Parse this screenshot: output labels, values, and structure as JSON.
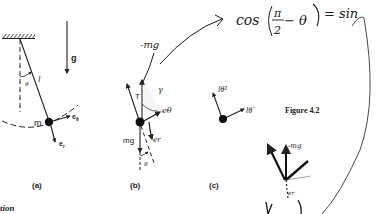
{
  "figure": {
    "caption": "Figure 4.2",
    "partial_heading": "tion"
  },
  "panel_a": {
    "label": "(a)",
    "gravity": "g",
    "length": "l",
    "angle": "θ",
    "mass": "m",
    "unit_theta": "e",
    "unit_theta_sub": "θ",
    "unit_r": "e",
    "unit_r_sub": "r"
  },
  "panel_b": {
    "label": "(b)",
    "tension": "T",
    "weight": "mg",
    "angle": "θ",
    "annotation_neg_mg": "-mg",
    "annotation_gamma": "γ",
    "annotation_e_theta": "eθ",
    "annotation_e_r": "er"
  },
  "panel_c": {
    "label": "(c)",
    "centripetal": "lθ̇²",
    "tangential": "lθ̈"
  },
  "annotations": {
    "equation_left": "cos",
    "equation_fraction_num": "π",
    "equation_fraction_den": "2",
    "equation_minus_theta": "− θ",
    "equation_right": "= sin",
    "sketch_label_top": "-mg",
    "sketch_label_bottom": "er"
  },
  "colors": {
    "ink": "#222222",
    "pen": "#1a1a1a",
    "background": "#ffffff"
  }
}
